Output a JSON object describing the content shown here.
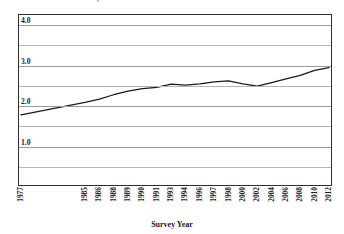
{
  "chart_data": {
    "type": "line",
    "title": "General Attitudes Scale, 1977 - 2012",
    "xlabel": "Survey Year",
    "ylabel": "",
    "ylim": [
      0.0,
      4.25
    ],
    "yticks": [
      "1.0",
      "2.0",
      "3.0",
      "4.0"
    ],
    "ytick_values": [
      1.0,
      2.0,
      3.0,
      4.0
    ],
    "minor_gridlines": [
      0.5,
      1.5,
      2.5,
      3.5
    ],
    "grid": true,
    "legend": "none",
    "categories": [
      "1977",
      "1985",
      "1986",
      "1988",
      "1989",
      "1990",
      "1991",
      "1993",
      "1994",
      "1996",
      "1997",
      "1998",
      "2000",
      "2002",
      "2004",
      "2006",
      "2008",
      "2010",
      "2012"
    ],
    "values": [
      1.78,
      2.09,
      2.17,
      2.28,
      2.37,
      2.43,
      2.46,
      2.54,
      2.52,
      2.55,
      2.6,
      2.62,
      2.55,
      2.49,
      2.58,
      2.67,
      2.76,
      2.88,
      2.95
    ],
    "series": [
      {
        "name": "General Attitudes Scale",
        "values": [
          1.78,
          2.09,
          2.17,
          2.28,
          2.37,
          2.43,
          2.46,
          2.54,
          2.52,
          2.55,
          2.6,
          2.62,
          2.55,
          2.49,
          2.58,
          2.67,
          2.76,
          2.88,
          2.95
        ]
      }
    ],
    "line_color": "#1a1a1a",
    "frame_color": "#2e2e2e",
    "gridline_color": "#9a9a9a"
  }
}
